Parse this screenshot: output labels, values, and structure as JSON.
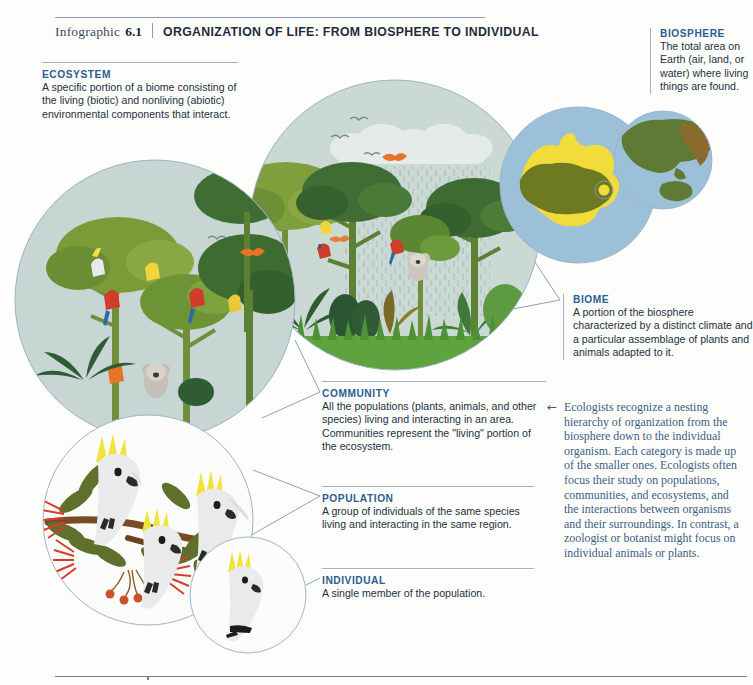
{
  "header": {
    "label": "Infographic",
    "number": "6.1",
    "title": "ORGANIZATION OF LIFE: FROM BIOSPHERE TO INDIVIDUAL"
  },
  "callouts": {
    "ecosystem": {
      "title": "ECOSYSTEM",
      "body": "A specific portion of a biome consisting of the living (biotic) and nonliving (abiotic) environmental components that interact."
    },
    "biosphere": {
      "title": "BIOSPHERE",
      "body": "The total area on Earth (air, land, or water) where living things are found."
    },
    "biome": {
      "title": "BIOME",
      "body": "A portion of the biosphere characterized by a distinct climate and a particular assemblage of plants and animals adapted to it."
    },
    "community": {
      "title": "COMMUNITY",
      "body": "All the populations (plants, animals, and other species) living and interacting in an area. Communities represent the \"living\" portion of the ecosystem."
    },
    "population": {
      "title": "POPULATION",
      "body": "A group of individuals of the same species living and interacting in the same region."
    },
    "individual": {
      "title": "INDIVIDUAL",
      "body": "A single member of the population."
    }
  },
  "note": {
    "arrow": "←",
    "body": "Ecologists recognize a nesting hierarchy of organization from the biosphere down to the individual organism. Each category is made up of the smaller ones. Ecologists often focus their study on populations, communities, and ecosystems, and the interactions between organisms and their surroundings. In contrast, a zoologist or botanist might focus on individual animals or plants."
  },
  "colors": {
    "accent_heading": "#2c5d8f",
    "rule": "#9fb4c9",
    "body_text": "#23313f",
    "note_text": "#3b5d82",
    "circle_stroke": "#93adc4",
    "sky_fill": "#c9d8d4",
    "globe_ocean": "#9cc0d8",
    "globe_land": "#5f7a34",
    "biome_highlight": "#f2dc3c",
    "canopy_light": "#7d9c3a",
    "canopy_mid": "#4f7a3a",
    "canopy_dark": "#2f5c34",
    "trunk": "#6f8f3a",
    "grass": "#63a23f",
    "cockatoo_body": "#e9eaec",
    "cockatoo_crest": "#f2e23c",
    "flower_red": "#d83b2a",
    "leaf_olive": "#5f6f2c",
    "branch_brown": "#7a4a24"
  },
  "scene": {
    "ecosystem_circle": "rainforest canopy with clouds, rain, flying birds, parrots, koala",
    "community_circle": "forest trees with parrots, cockatoos and a koala",
    "population_circle": "three sulphur-crested cockatoos on a flowering eucalyptus branch",
    "individual_circle": "a single sulphur-crested cockatoo",
    "biome_circle": "map of Australia highlighted in yellow on a blue globe",
    "biosphere_circle": "globe of Earth showing Asia and Australia"
  }
}
